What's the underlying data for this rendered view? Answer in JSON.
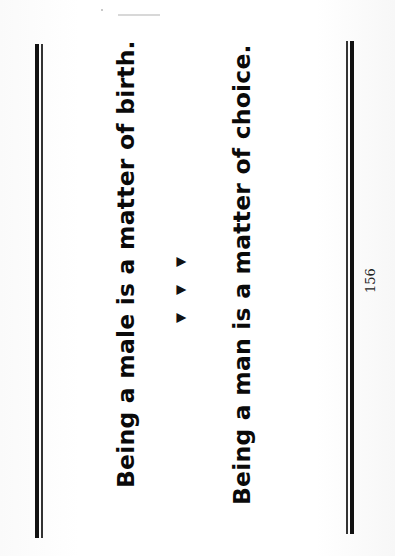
{
  "document": {
    "orientation": "rotated-90-ccw",
    "statements": [
      "Being a male is a matter of birth.",
      "Being a man is a matter of choice."
    ],
    "separator": {
      "icon": "triangle-bullet-icon",
      "glyphs": [
        "▲",
        "▲",
        "▲"
      ]
    },
    "page_number": "156"
  }
}
